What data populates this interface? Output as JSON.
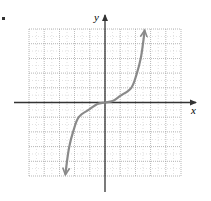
{
  "chart_data": {
    "type": "line",
    "title": "",
    "xlabel": "x",
    "ylabel": "y",
    "xlim": [
      -5,
      5
    ],
    "ylim": [
      -5,
      5
    ],
    "grid": true,
    "grid_step": 1,
    "minor_grid_step": 0.5,
    "tick_labels_shown": false,
    "series": [
      {
        "name": "curve",
        "arrows_both_ends": true,
        "x": [
          -2.6,
          -2.5,
          -2.35,
          -2.1,
          -1.73,
          -1.0,
          -0.5,
          0,
          0.5,
          1.0,
          1.73,
          2.1,
          2.35,
          2.5,
          2.6
        ],
        "y": [
          -4.85,
          -4.0,
          -3.0,
          -2.0,
          -1.0,
          -0.45,
          -0.1,
          0,
          0.1,
          0.45,
          1.0,
          2.0,
          3.0,
          4.0,
          4.85
        ]
      }
    ]
  },
  "colors": {
    "axis": "#333333",
    "grid": "#9a9a9a",
    "curve": "#8a8a8a"
  }
}
